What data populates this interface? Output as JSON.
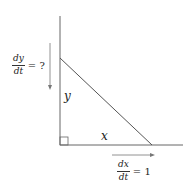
{
  "diagram": {
    "labels": {
      "y_side": "y",
      "x_side": "x"
    },
    "rate_y": {
      "numerator": "dy",
      "denominator": "dt",
      "rhs": "= ?"
    },
    "rate_x": {
      "numerator": "dx",
      "denominator": "dt",
      "rhs": "= 1"
    },
    "colors": {
      "line": "#555555",
      "text": "#222222"
    }
  }
}
